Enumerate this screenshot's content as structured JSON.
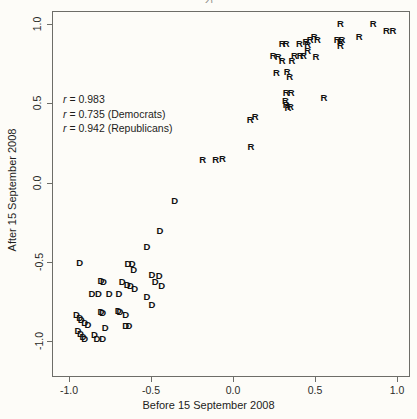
{
  "figure": {
    "title_fragment": "2)",
    "background_color": "#fdfcf8",
    "frame_color": "#6d6d68",
    "point_color": "#111111"
  },
  "annotations": [
    {
      "symbol": "r",
      "text": " = 0.983"
    },
    {
      "symbol": "r",
      "text": " = 0.735 (Democrats)"
    },
    {
      "symbol": "r",
      "text": " = 0.942 (Republicans)"
    }
  ],
  "axes": {
    "xlabel": "Before 15 September 2008",
    "ylabel": "After 15 September 2008",
    "xticks": [
      "-1.0",
      "-0.5",
      "0.0",
      "0.5",
      "1.0"
    ],
    "yticks": [
      "1.0",
      "0.5",
      "0.0",
      "-0.5",
      "-1.0"
    ]
  },
  "chart_data": {
    "type": "scatter",
    "title": "",
    "xlabel": "Before 15 September 2008",
    "ylabel": "After 15 September 2008",
    "xlim": [
      -1.1,
      1.08
    ],
    "ylim": [
      -1.1,
      1.08
    ],
    "xticks": [
      -1.0,
      -0.5,
      0.0,
      0.5,
      1.0
    ],
    "yticks": [
      -1.0,
      -0.5,
      0.0,
      0.5,
      1.0
    ],
    "grid": false,
    "legend": "none",
    "annotations": [
      "r = 0.983",
      "r = 0.735 (Democrats)",
      "r = 0.942 (Republicans)"
    ],
    "correlations": {
      "all": 0.983,
      "democrats": 0.735,
      "republicans": 0.942
    },
    "series": [
      {
        "name": "Republicans",
        "marker": "R",
        "points": [
          [
            0.655,
            1.0
          ],
          [
            0.855,
            1.0
          ],
          [
            0.935,
            0.955
          ],
          [
            0.975,
            0.955
          ],
          [
            0.77,
            0.915
          ],
          [
            0.495,
            0.915
          ],
          [
            0.47,
            0.9
          ],
          [
            0.515,
            0.9
          ],
          [
            0.635,
            0.9
          ],
          [
            0.665,
            0.9
          ],
          [
            0.655,
            0.885
          ],
          [
            0.655,
            0.86
          ],
          [
            0.445,
            0.885
          ],
          [
            0.455,
            0.865
          ],
          [
            0.405,
            0.875
          ],
          [
            0.3,
            0.875
          ],
          [
            0.325,
            0.875
          ],
          [
            0.455,
            0.83
          ],
          [
            0.245,
            0.8
          ],
          [
            0.275,
            0.79
          ],
          [
            0.375,
            0.8
          ],
          [
            0.41,
            0.8
          ],
          [
            0.43,
            0.8
          ],
          [
            0.505,
            0.79
          ],
          [
            0.3,
            0.765
          ],
          [
            0.36,
            0.765
          ],
          [
            0.265,
            0.69
          ],
          [
            0.33,
            0.7
          ],
          [
            0.345,
            0.665
          ],
          [
            0.325,
            0.565
          ],
          [
            0.355,
            0.565
          ],
          [
            0.555,
            0.53
          ],
          [
            0.32,
            0.515
          ],
          [
            0.325,
            0.49
          ],
          [
            0.35,
            0.475
          ],
          [
            0.335,
            0.47
          ],
          [
            0.105,
            0.395
          ],
          [
            0.135,
            0.415
          ],
          [
            0.11,
            0.225
          ],
          [
            -0.185,
            0.145
          ],
          [
            -0.105,
            0.14
          ],
          [
            -0.065,
            0.15
          ]
        ]
      },
      {
        "name": "Democrats",
        "marker": "D",
        "points": [
          [
            -0.355,
            -0.115
          ],
          [
            -0.445,
            -0.305
          ],
          [
            -0.525,
            -0.405
          ],
          [
            -0.935,
            -0.505
          ],
          [
            -0.64,
            -0.515
          ],
          [
            -0.615,
            -0.515
          ],
          [
            -0.605,
            -0.555
          ],
          [
            -0.495,
            -0.585
          ],
          [
            -0.45,
            -0.59
          ],
          [
            -0.805,
            -0.62
          ],
          [
            -0.79,
            -0.625
          ],
          [
            -0.675,
            -0.625
          ],
          [
            -0.645,
            -0.645
          ],
          [
            -0.625,
            -0.655
          ],
          [
            -0.475,
            -0.63
          ],
          [
            -0.435,
            -0.655
          ],
          [
            -0.6,
            -0.67
          ],
          [
            -0.86,
            -0.705
          ],
          [
            -0.82,
            -0.705
          ],
          [
            -0.755,
            -0.705
          ],
          [
            -0.695,
            -0.705
          ],
          [
            -0.525,
            -0.72
          ],
          [
            -0.495,
            -0.775
          ],
          [
            -0.805,
            -0.815
          ],
          [
            -0.795,
            -0.825
          ],
          [
            -0.7,
            -0.81
          ],
          [
            -0.69,
            -0.82
          ],
          [
            -0.655,
            -0.835
          ],
          [
            -0.955,
            -0.835
          ],
          [
            -0.935,
            -0.855
          ],
          [
            -0.925,
            -0.87
          ],
          [
            -0.905,
            -0.885
          ],
          [
            -0.885,
            -0.9
          ],
          [
            -0.655,
            -0.905
          ],
          [
            -0.635,
            -0.905
          ],
          [
            -0.78,
            -0.915
          ],
          [
            -0.945,
            -0.935
          ],
          [
            -0.93,
            -0.955
          ],
          [
            -0.915,
            -0.975
          ],
          [
            -0.905,
            -0.99
          ],
          [
            -0.845,
            -0.965
          ],
          [
            -0.83,
            -0.99
          ],
          [
            -0.795,
            -0.99
          ]
        ]
      }
    ]
  }
}
